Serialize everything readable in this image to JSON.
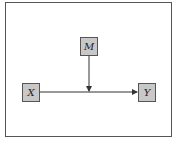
{
  "diagram": {
    "type": "path-diagram",
    "nodes": [
      {
        "id": "x",
        "label": "X",
        "role": "predictor"
      },
      {
        "id": "m",
        "label": "M",
        "role": "moderator"
      },
      {
        "id": "y",
        "label": "Y",
        "role": "outcome"
      }
    ],
    "edges": [
      {
        "from": "x",
        "to": "y",
        "style": "arrow"
      },
      {
        "from": "m",
        "to": "x-y-path",
        "style": "arrow"
      }
    ],
    "colors": {
      "node_fill": "#c8c8c8",
      "node_border": "#555555",
      "line": "#333333",
      "frame": "#555555",
      "background": "#ffffff"
    }
  }
}
